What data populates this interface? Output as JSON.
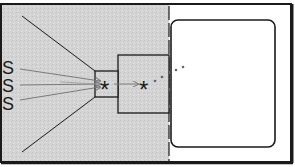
{
  "diagram": {
    "title": "",
    "source_labels": [
      "S",
      "S",
      "S"
    ],
    "symbols": {
      "inner_star": "*",
      "outer_star": "*"
    },
    "colors": {
      "background_left": "#d6d6d6",
      "background_right": "#ffffff",
      "stroke": "#1a1a1a",
      "arrow": "#7a7a7a",
      "dots": "#666666"
    },
    "elements": {
      "outer_frame": "frame",
      "left_region": "gray shaded region",
      "divider": "vertical dashed line",
      "screen": "rounded rectangle",
      "small_box": "pinhole box",
      "large_box": "chamber box",
      "cone_lines": 2,
      "arrows": 3,
      "dots": 4
    }
  }
}
